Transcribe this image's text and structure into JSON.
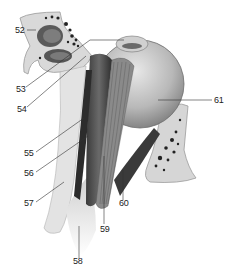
{
  "figure": {
    "colors": {
      "bone": "#d8d8d8",
      "bone_edge": "#a8a8a8",
      "globe": "#bdbdbd",
      "muscle": "#4a4a4a",
      "fat": "#e6e6e6",
      "leader": "#333333",
      "text": "#222222"
    }
  },
  "labels": [
    {
      "id": "52",
      "text": "52"
    },
    {
      "id": "53",
      "text": "53"
    },
    {
      "id": "54",
      "text": "54"
    },
    {
      "id": "55",
      "text": "55"
    },
    {
      "id": "56",
      "text": "56"
    },
    {
      "id": "57",
      "text": "57"
    },
    {
      "id": "58",
      "text": "58"
    },
    {
      "id": "59",
      "text": "59"
    },
    {
      "id": "60",
      "text": "60"
    },
    {
      "id": "61",
      "text": "61"
    }
  ]
}
